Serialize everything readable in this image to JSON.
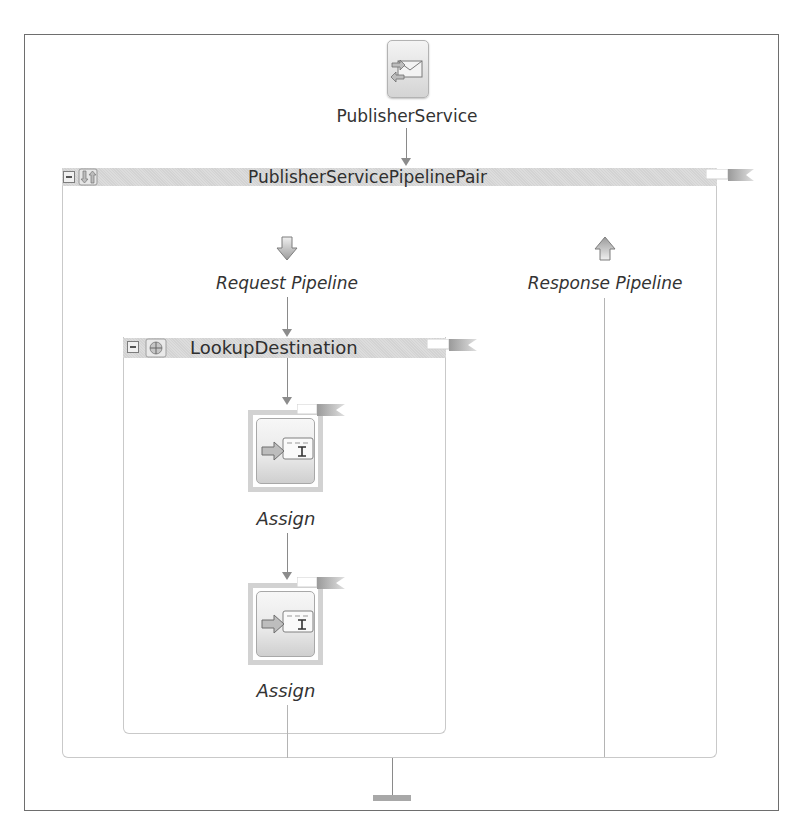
{
  "service": {
    "name": "PublisherService",
    "icon": "envelope-service-icon"
  },
  "pipeline_pair": {
    "title": "PublisherServicePipelinePair",
    "icon": "pipeline-pair-icon",
    "collapse_icon": "collapse-minus-icon",
    "request": {
      "label": "Request Pipeline",
      "icon": "down-arrow-icon"
    },
    "response": {
      "label": "Response Pipeline",
      "icon": "up-arrow-icon"
    }
  },
  "stage": {
    "title": "LookupDestination",
    "icon": "stage-icon",
    "collapse_icon": "collapse-minus-icon",
    "actions": [
      {
        "label": "Assign",
        "icon": "assign-action-icon"
      },
      {
        "label": "Assign",
        "icon": "assign-action-icon"
      }
    ]
  },
  "colors": {
    "header_bar": "#d6d6d6",
    "connector": "#8a8a8a",
    "frame_border": "#6e6e6e"
  }
}
